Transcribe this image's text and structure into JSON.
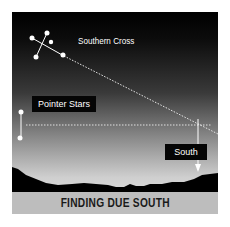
{
  "diagram": {
    "title": "FINDING DUE SOUTH",
    "labels": {
      "southern_cross": "Southern Cross",
      "pointer_stars": "Pointer Stars",
      "south": "South"
    },
    "colors": {
      "sky_top": "#000000",
      "sky_bottom": "#d8d8d8",
      "ground": "#000000",
      "caption_bg": "#bdbdbd",
      "caption_text": "#1a1a1a",
      "lines": "#ffffff"
    }
  }
}
